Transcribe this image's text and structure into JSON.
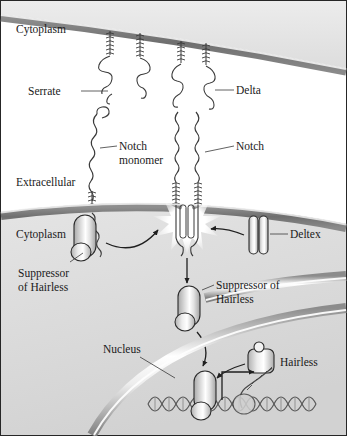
{
  "figure": {
    "border_color": "#262626",
    "background_color": "#ffffff",
    "cell_fill": "#d9d9d9",
    "membrane_color": "#7d7d7d",
    "protein_fill": "#e8e8e8",
    "protein_stroke": "#2b2b2b",
    "dna_color": "#555555"
  },
  "labels": {
    "cytoplasm_top": "Cytoplasm",
    "extracellular": "Extracellular",
    "cytoplasm_bottom": "Cytoplasm",
    "serrate": "Serrate",
    "delta": "Delta",
    "notch_monomer_line1": "Notch",
    "notch_monomer_line2": "monomer",
    "notch": "Notch",
    "deltex": "Deltex",
    "suppressor_left_line1": "Suppressor",
    "suppressor_left_line2": "of Hairless",
    "suppressor_mid_line1": "Suppressor of",
    "suppressor_mid_line2": "Hairless",
    "nucleus": "Nucleus",
    "hairless": "Hairless"
  },
  "elements": {
    "signaling_cell": "upper cell displaying Serrate and Delta ligands",
    "receiving_cell": "lower cell with Notch receptors, cytoplasm and nucleus",
    "activation_burst": "starburst at activated Notch receptor",
    "dna": "double helix DNA strand in nucleus",
    "transcript": "nascent RNA transcript"
  }
}
